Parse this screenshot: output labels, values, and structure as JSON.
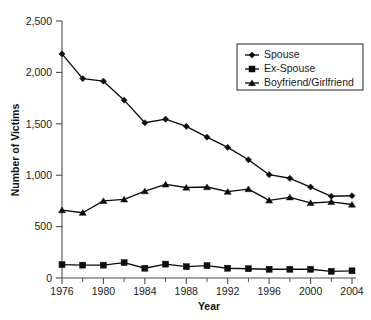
{
  "chart_data": {
    "type": "line",
    "title": "",
    "xlabel": "Year",
    "ylabel": "Number of Victims",
    "x": [
      1976,
      1978,
      1980,
      1982,
      1984,
      1986,
      1988,
      1990,
      1992,
      1994,
      1996,
      1998,
      2000,
      2002,
      2004
    ],
    "xlim": [
      1976,
      2004
    ],
    "ylim": [
      0,
      2500
    ],
    "grid": false,
    "legend_position": "top-right",
    "xticks_major": [
      1976,
      1980,
      1984,
      1988,
      1992,
      1996,
      2000,
      2004
    ],
    "xtick_labels": [
      "1976",
      "1980",
      "1984",
      "1988",
      "1992",
      "1996",
      "2000",
      "2004"
    ],
    "xticks_minor": [
      1978,
      1982,
      1986,
      1990,
      1994,
      1998,
      2002
    ],
    "yticks": [
      0,
      500,
      1000,
      1500,
      2000,
      2500
    ],
    "ytick_labels": [
      "0",
      "500",
      "1,000",
      "1,500",
      "2,000",
      "2,500"
    ],
    "series": [
      {
        "name": "Spouse",
        "marker": "diamond",
        "color": "#0d0d0d",
        "values": [
          2180,
          1940,
          1915,
          1730,
          1510,
          1545,
          1475,
          1370,
          1270,
          1150,
          1005,
          970,
          885,
          795,
          800
        ]
      },
      {
        "name": "Ex-Spouse",
        "marker": "square",
        "color": "#0d0d0d",
        "values": [
          130,
          125,
          125,
          150,
          95,
          135,
          110,
          120,
          95,
          90,
          85,
          85,
          85,
          65,
          70
        ]
      },
      {
        "name": "Boyfriend/Girlfriend",
        "marker": "triangle",
        "color": "#0d0d0d",
        "values": [
          660,
          635,
          750,
          765,
          845,
          910,
          880,
          885,
          840,
          865,
          755,
          785,
          730,
          740,
          715
        ]
      }
    ]
  },
  "legend": {
    "entries": [
      {
        "label": "Spouse",
        "marker": "diamond"
      },
      {
        "label": "Ex-Spouse",
        "marker": "square"
      },
      {
        "label": "Boyfriend/Girlfriend",
        "marker": "triangle"
      }
    ]
  },
  "axes": {
    "x_title": "Year",
    "y_title": "Number of Victims"
  }
}
